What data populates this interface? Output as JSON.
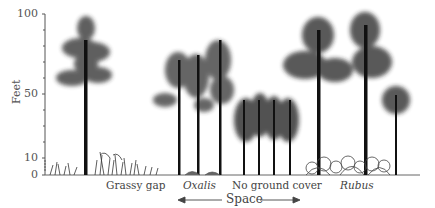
{
  "diagram": {
    "y_axis": {
      "label": "Feet",
      "ticks": [
        "100",
        "50",
        "10",
        "0"
      ]
    },
    "x_axis": {
      "label": "Space",
      "arrow_left": "←",
      "arrow_right": "→"
    },
    "zones": [
      {
        "label": "Grassy gap",
        "italic": false
      },
      {
        "label": "Oxalis",
        "italic": true
      },
      {
        "label": "No ground cover",
        "italic": false
      },
      {
        "label": "Rubus",
        "italic": true
      }
    ]
  }
}
